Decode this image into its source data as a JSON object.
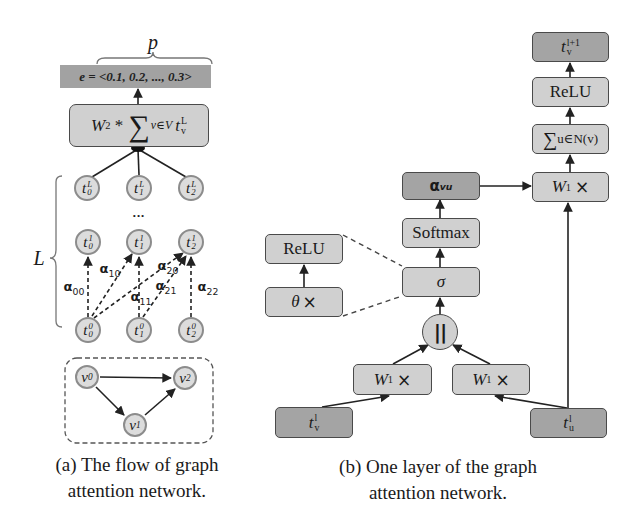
{
  "colors": {
    "light_box": "#d0d0d0",
    "dark_box": "#a4a4a4",
    "banner": "#a2a2a2",
    "stroke": "#4a4a4a",
    "node_ring": "#8c8c8c",
    "node_fill": "#dcdcdc"
  },
  "panel_a": {
    "p_label": "p",
    "embedding": "e = <0.1, 0.2, ..., 0.3>",
    "readout": {
      "w": "W",
      "w_sub": "2",
      "op": " * ",
      "sum": "∑",
      "sum_sub": "v∈V",
      "t": "t",
      "t_sup": "L",
      "t_sub": "v"
    },
    "layer_label": "L",
    "ellipsis": "•••",
    "layers": {
      "top": [
        {
          "base": "t",
          "sup": "L",
          "sub": "0"
        },
        {
          "base": "t",
          "sup": "L",
          "sub": "1"
        },
        {
          "base": "t",
          "sup": "L",
          "sub": "2"
        }
      ],
      "l1": [
        {
          "base": "t",
          "sup": "1",
          "sub": "0"
        },
        {
          "base": "t",
          "sup": "1",
          "sub": "1"
        },
        {
          "base": "t",
          "sup": "1",
          "sub": "2"
        }
      ],
      "l0": [
        {
          "base": "t",
          "sup": "0",
          "sub": "0"
        },
        {
          "base": "t",
          "sup": "0",
          "sub": "1"
        },
        {
          "base": "t",
          "sup": "0",
          "sub": "2"
        }
      ]
    },
    "attention_weights": [
      {
        "base": "α",
        "sub": "00"
      },
      {
        "base": "α",
        "sub": "10"
      },
      {
        "base": "α",
        "sub": "11"
      },
      {
        "base": "α",
        "sub": "20"
      },
      {
        "base": "α",
        "sub": "21"
      },
      {
        "base": "α",
        "sub": "22"
      }
    ],
    "graph": {
      "nodes": [
        {
          "base": "v",
          "sub": "0"
        },
        {
          "base": "v",
          "sub": "1"
        },
        {
          "base": "v",
          "sub": "2"
        }
      ],
      "edges": [
        [
          "v0",
          "v2"
        ],
        [
          "v0",
          "v1"
        ],
        [
          "v1",
          "v2"
        ]
      ]
    },
    "caption": [
      "(a) The flow of graph",
      "attention network."
    ]
  },
  "panel_b": {
    "output": {
      "base": "t",
      "sup": "l+1",
      "sub": "v"
    },
    "relu_top": "ReLU",
    "aggregate": {
      "sum": "∑",
      "sub": "u∈N(v)"
    },
    "w1_top": {
      "base": "W",
      "sub": "1",
      "op": "×"
    },
    "alpha": {
      "base": "α",
      "sub": "vu"
    },
    "softmax": "Softmax",
    "sigma": "σ",
    "relu_side": "ReLU",
    "theta": {
      "base": "θ",
      "op": "×"
    },
    "concat": "||",
    "w1_left": {
      "base": "W",
      "sub": "1",
      "op": "×"
    },
    "w1_right": {
      "base": "W",
      "sub": "1",
      "op": "×"
    },
    "t_v": {
      "base": "t",
      "sup": "l",
      "sub": "v"
    },
    "t_u": {
      "base": "t",
      "sup": "l",
      "sub": "u"
    },
    "caption": [
      "(b) One layer of the graph",
      "attention network."
    ]
  }
}
